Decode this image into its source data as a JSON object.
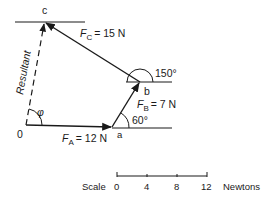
{
  "diagram": {
    "points": {
      "origin": {
        "label": "0",
        "x": 26,
        "y": 125
      },
      "a": {
        "label": "a",
        "x": 112,
        "y": 127
      },
      "b": {
        "label": "b",
        "x": 140,
        "y": 82
      },
      "c": {
        "label": "c",
        "x": 45,
        "y": 22
      }
    },
    "forces": [
      {
        "id": "FA",
        "symbol": "F",
        "subscript": "A",
        "value": "= 12 N",
        "from": "origin",
        "to": "a"
      },
      {
        "id": "FB",
        "symbol": "F",
        "subscript": "B",
        "value": "= 7 N",
        "from": "a",
        "to": "b"
      },
      {
        "id": "FC",
        "symbol": "F",
        "subscript": "C",
        "value": "= 15 N",
        "from": "b",
        "to": "c"
      }
    ],
    "resultant": {
      "label": "Resultant",
      "from": "origin",
      "to": "c",
      "style": "dashed"
    },
    "angles": {
      "phi": "φ",
      "at_a": "60°",
      "at_b": "150°"
    },
    "scale": {
      "label": "Scale",
      "ticks": [
        "0",
        "4",
        "8",
        "12"
      ],
      "unit": "Newtons"
    },
    "colors": {
      "ink": "#1a1a1a",
      "background": "#ffffff"
    }
  }
}
